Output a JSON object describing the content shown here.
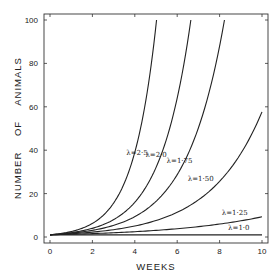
{
  "chart_data": {
    "type": "line",
    "title": "",
    "xlabel": "WEEKS",
    "ylabel": "NUMBER OF ANIMALS",
    "xlim": [
      0,
      10
    ],
    "ylim": [
      0,
      100
    ],
    "x_ticks": [
      0,
      2,
      4,
      6,
      8,
      10
    ],
    "y_ticks": [
      0,
      20,
      40,
      60,
      80,
      100
    ],
    "grid": false,
    "legend": "inline curve labels",
    "model": "N(t) = λ^t",
    "series": [
      {
        "name": "λ=2·5",
        "lambda": 2.5,
        "x": [
          0,
          1,
          2,
          3,
          4,
          5,
          5.03
        ],
        "values": [
          1,
          2.5,
          6.25,
          15.6,
          39.1,
          97.7,
          100
        ]
      },
      {
        "name": "λ=2·0",
        "lambda": 2.0,
        "x": [
          0,
          1,
          2,
          3,
          4,
          5,
          6,
          6.64
        ],
        "values": [
          1,
          2,
          4,
          8,
          16,
          32,
          64,
          100
        ]
      },
      {
        "name": "λ=1·75",
        "lambda": 1.75,
        "x": [
          0,
          1,
          2,
          3,
          4,
          5,
          6,
          7,
          8,
          8.23
        ],
        "values": [
          1,
          1.75,
          3.06,
          5.36,
          9.38,
          16.4,
          28.7,
          50.3,
          87.9,
          100
        ]
      },
      {
        "name": "λ=1·50",
        "lambda": 1.5,
        "x": [
          0,
          1,
          2,
          3,
          4,
          5,
          6,
          7,
          8,
          9,
          10
        ],
        "values": [
          1,
          1.5,
          2.25,
          3.38,
          5.06,
          7.59,
          11.4,
          17.1,
          25.6,
          38.4,
          57.7
        ]
      },
      {
        "name": "λ=1·25",
        "lambda": 1.25,
        "x": [
          0,
          2,
          4,
          6,
          8,
          10
        ],
        "values": [
          1,
          1.56,
          2.44,
          3.81,
          5.96,
          9.31
        ]
      },
      {
        "name": "λ=1·0",
        "lambda": 1.0,
        "x": [
          0,
          10
        ],
        "values": [
          1,
          1
        ]
      }
    ],
    "labels": [
      {
        "text": "λ=2·5",
        "x": 3.6,
        "y": 38
      },
      {
        "text": "λ=2·0",
        "x": 4.5,
        "y": 37
      },
      {
        "text": "λ=1·75",
        "x": 5.5,
        "y": 34
      },
      {
        "text": "λ=1·50",
        "x": 6.5,
        "y": 26
      },
      {
        "text": "λ=1·25",
        "x": 8.1,
        "y": 10
      },
      {
        "text": "λ=1·0",
        "x": 8.4,
        "y": 3
      }
    ]
  }
}
